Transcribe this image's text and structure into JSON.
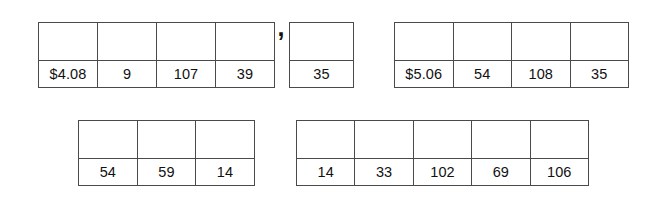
{
  "page": {
    "background_color": "#ffffff",
    "border_color": "#4a4a4a",
    "text_color": "#111111"
  },
  "separator": {
    "symbol": ",",
    "name": "comma"
  },
  "tables": [
    {
      "id": "table-1",
      "position": "top-left",
      "columns": 4,
      "rows": 2,
      "top_row": [
        "",
        "",
        "",
        ""
      ],
      "values": [
        "$4.08",
        "9",
        "107",
        "39"
      ]
    },
    {
      "id": "table-2",
      "position": "top-middle",
      "columns": 1,
      "rows": 2,
      "top_row": [
        ""
      ],
      "values": [
        "35"
      ]
    },
    {
      "id": "table-3",
      "position": "top-right",
      "columns": 4,
      "rows": 2,
      "top_row": [
        "",
        "",
        "",
        ""
      ],
      "values": [
        "$5.06",
        "54",
        "108",
        "35"
      ]
    },
    {
      "id": "table-4",
      "position": "bottom-left",
      "columns": 3,
      "rows": 2,
      "top_row": [
        "",
        "",
        ""
      ],
      "values": [
        "54",
        "59",
        "14"
      ]
    },
    {
      "id": "table-5",
      "position": "bottom-right",
      "columns": 5,
      "rows": 2,
      "top_row": [
        "",
        "",
        "",
        "",
        ""
      ],
      "values": [
        "14",
        "33",
        "102",
        "69",
        "106"
      ]
    }
  ]
}
